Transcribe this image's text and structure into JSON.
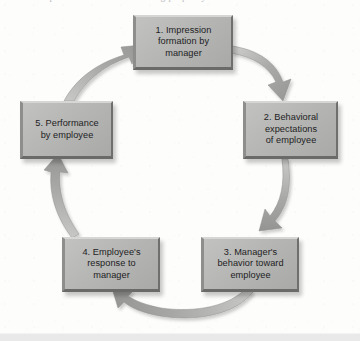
{
  "figure": {
    "title_fragment": "the process of the self-fulfilling prophecy",
    "type": "cycle-diagram",
    "direction": "clockwise",
    "step_count": 5,
    "colors": {
      "box_fill": "#b6b6b4",
      "box_highlight": "#d6d6d4",
      "box_shadow": "#6a6a68",
      "arrow": "#a6a6a4",
      "text": "#1d1d1f",
      "background": "#fdfdfc",
      "bottom_band": "#e9e9ea"
    }
  },
  "nodes": [
    {
      "id": "node-1",
      "number": "1.",
      "label": "1. Impression\nformation by\nmanager"
    },
    {
      "id": "node-2",
      "number": "2.",
      "label": "2. Behavioral\nexpectations\nof employee"
    },
    {
      "id": "node-3",
      "number": "3.",
      "label": "3. Manager's\nbehavior toward\nemployee"
    },
    {
      "id": "node-4",
      "number": "4.",
      "label": "4. Employee's\nresponse to\nmanager"
    },
    {
      "id": "node-5",
      "number": "5.",
      "label": "5. Performance\nby employee"
    }
  ],
  "arrows": [
    {
      "id": "arrow-1-to-2",
      "from": "node-1",
      "to": "node-2",
      "position": "top-right"
    },
    {
      "id": "arrow-2-to-3",
      "from": "node-2",
      "to": "node-3",
      "position": "right"
    },
    {
      "id": "arrow-3-to-4",
      "from": "node-3",
      "to": "node-4",
      "position": "bottom"
    },
    {
      "id": "arrow-4-to-5",
      "from": "node-4",
      "to": "node-5",
      "position": "left"
    },
    {
      "id": "arrow-5-to-1",
      "from": "node-5",
      "to": "node-1",
      "position": "top-left"
    }
  ]
}
